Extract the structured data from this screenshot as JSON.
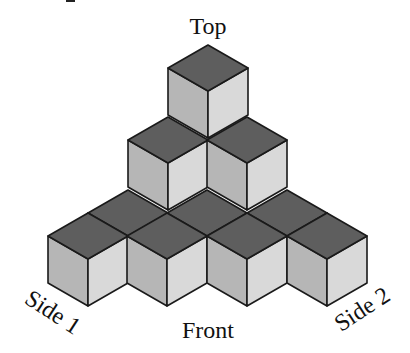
{
  "figure": {
    "labels": {
      "top": "Top",
      "front": "Front",
      "side1": "Side 1",
      "side2": "Side 2"
    },
    "colors": {
      "top_face": "#5e5e5e",
      "left_face": "#b6b6b6",
      "right_face": "#d9d9d9",
      "edge": "#1a1a1a",
      "background": "#ffffff"
    },
    "cube_geometry": {
      "half_width": 40,
      "half_top_height": 23,
      "vertical_edge": 47
    },
    "cubes": [
      {
        "layer": 1,
        "row": "back",
        "x": 128,
        "y": 190
      },
      {
        "layer": 1,
        "row": "back",
        "x": 207,
        "y": 190
      },
      {
        "layer": 1,
        "row": "back",
        "x": 287,
        "y": 190
      },
      {
        "layer": 1,
        "row": "front",
        "x": 88,
        "y": 213
      },
      {
        "layer": 1,
        "row": "front",
        "x": 167,
        "y": 213
      },
      {
        "layer": 1,
        "row": "front",
        "x": 247,
        "y": 213
      },
      {
        "layer": 1,
        "row": "front",
        "x": 327,
        "y": 213
      },
      {
        "layer": 2,
        "row": "middle",
        "x": 168,
        "y": 117
      },
      {
        "layer": 2,
        "row": "middle",
        "x": 247,
        "y": 117
      },
      {
        "layer": 3,
        "row": "top",
        "x": 208,
        "y": 45
      }
    ]
  }
}
